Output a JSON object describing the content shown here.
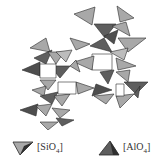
{
  "diagram": {
    "type": "polyhedral-crystal-structure",
    "colors": {
      "sio4_fill": "#a8a8a8",
      "alo4_fill": "#5e5e5e",
      "edge": "#2a2a2a",
      "background": "#ffffff"
    }
  },
  "legend": {
    "items": [
      {
        "symbol": "sio4-tetrahedron",
        "label_prefix": "[SiO",
        "subscript": "4",
        "label_suffix": "]"
      },
      {
        "symbol": "alo4-tetrahedron",
        "label_prefix": "[AlO",
        "subscript": "4",
        "label_suffix": "]"
      }
    ]
  }
}
